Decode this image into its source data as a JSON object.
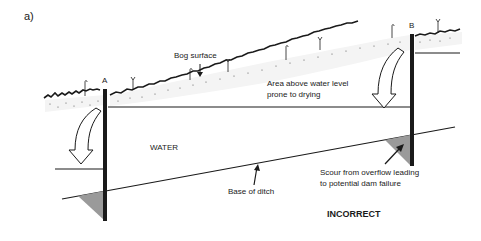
{
  "figure": {
    "panel_label": "a)",
    "dam_a_label": "A",
    "dam_b_label": "B",
    "bog_surface_label": "Bog surface",
    "area_label_line1": "Area above water level",
    "area_label_line2": "prone to drying",
    "water_label": "WATER",
    "base_label": "Base of ditch",
    "scour_label_line1": "Scour from overflow leading",
    "scour_label_line2": "to potential dam failure",
    "verdict_label": "INCORRECT"
  },
  "colors": {
    "ink": "#1a1a1a",
    "scour_fill": "#9a9a9a",
    "background": "#ffffff"
  }
}
